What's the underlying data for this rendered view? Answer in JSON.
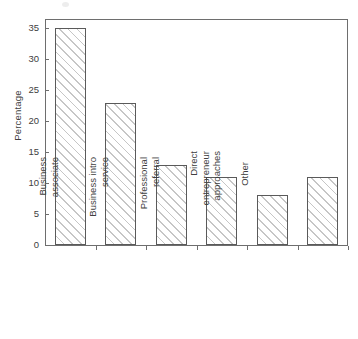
{
  "chart_data": {
    "type": "bar",
    "title": "",
    "xlabel": "",
    "ylabel": "Percentage",
    "categories": [
      "Friends/family",
      "Business associate",
      "Business intro service",
      "Professional referral",
      "Direct entrepreneur approaches",
      "Other"
    ],
    "category_lines": [
      [
        "Friends/family"
      ],
      [
        "Business",
        "associate"
      ],
      [
        "Business intro",
        "service"
      ],
      [
        "Professional",
        "referral"
      ],
      [
        "Direct",
        "entrepreneur",
        "approaches"
      ],
      [
        "Other"
      ]
    ],
    "values": [
      35,
      23,
      13,
      11,
      8,
      11
    ],
    "ylim": [
      0,
      36.5
    ],
    "yticks": [
      0,
      5,
      10,
      15,
      20,
      25,
      30,
      35
    ],
    "ytick_labels": [
      "0",
      "5",
      "10",
      "15",
      "20",
      "25",
      "30",
      "35"
    ],
    "grid": false,
    "legend": null,
    "bar_style": {
      "fill": "#ffffff",
      "hatch": "diagonal",
      "hatch_color": "#c6c6c6",
      "edge_color": "#5a5a5a"
    },
    "frame_color": "#6e6e6e",
    "text_color": "#404040"
  }
}
